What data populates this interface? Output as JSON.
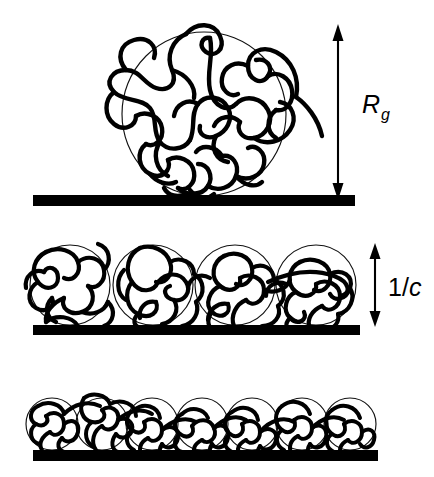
{
  "figure": {
    "title_visible": false,
    "background_color": "#ffffff",
    "ink_color": "#000000",
    "panels": [
      {
        "id": "panel-dilute",
        "description": "single isolated polymer coil on substrate",
        "coil_count": 1,
        "coil_radius_px": 82,
        "substrate": {
          "x": 33,
          "y": 195,
          "width": 322,
          "height": 11
        },
        "annotation": {
          "name": "radius-of-gyration-label",
          "symbol": "R",
          "subscript": "g",
          "arrow": {
            "x": 338,
            "y_top": 28,
            "y_bottom": 196
          },
          "label_x": 362,
          "label_y": 113
        }
      },
      {
        "id": "panel-overlap",
        "description": "four touching polymer coils at overlap concentration",
        "coil_count": 4,
        "coil_radius_px": 40,
        "coil_centers_x": [
          70,
          153,
          235,
          316
        ],
        "substrate": {
          "x": 33,
          "y": 325,
          "width": 327,
          "height": 10
        },
        "annotation": {
          "name": "inverse-concentration-label",
          "symbol": "1/",
          "italic_part": "c",
          "arrow": {
            "x": 375,
            "y_top": 245,
            "y_bottom": 325
          },
          "label_x": 388,
          "label_y": 296
        }
      },
      {
        "id": "panel-semidilute",
        "description": "seven compressed overlapping coils, semidilute regime",
        "coil_count": 7,
        "coil_radius_px": 26,
        "coil_centers_x": [
          52,
          102,
          152,
          202,
          252,
          302,
          350
        ],
        "substrate": {
          "x": 33,
          "y": 450,
          "width": 345,
          "height": 11
        },
        "annotation": null
      }
    ],
    "labels": {
      "rg": {
        "base": "R",
        "sub": "g"
      },
      "inv_c": {
        "prefix": "1/",
        "italic": "c"
      }
    }
  }
}
